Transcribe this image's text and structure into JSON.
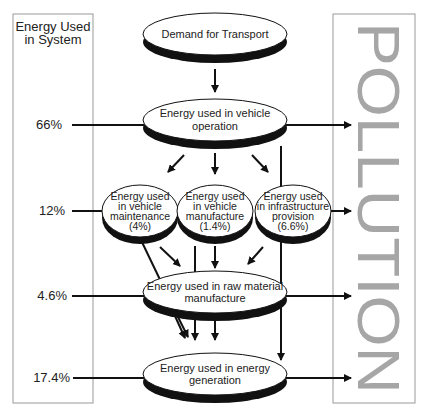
{
  "left_panel": {
    "title_line1": "Energy Used",
    "title_line2": "in System",
    "percentages": [
      "66%",
      "12%",
      "4.6%",
      "17.4%"
    ]
  },
  "right_panel": {
    "label": "POLLUTION",
    "text_color": "#a6a6a6"
  },
  "nodes": {
    "demand": {
      "line1": "Demand for Transport"
    },
    "operation": {
      "line1": "Energy used in vehicle",
      "line2": "operation"
    },
    "maintenance": {
      "line1": "Energy used",
      "line2": "in vehicle",
      "line3": "maintenance",
      "line4": "(4%)"
    },
    "manufacture": {
      "line1": "Energy used",
      "line2": "in vehicle",
      "line3": "manufacture",
      "line4": "(1.4%)"
    },
    "infrastructure": {
      "line1": "Energy used",
      "line2": "in infrastructure",
      "line3": "provision",
      "line4": "(6.6%)"
    },
    "raw_material": {
      "line1": "Energy used in raw material",
      "line2": "manufacture"
    },
    "generation": {
      "line1": "Energy used in energy",
      "line2": "generation"
    }
  }
}
